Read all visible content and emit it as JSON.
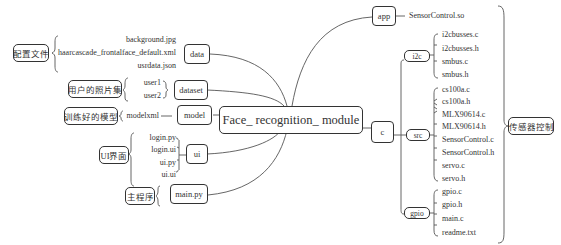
{
  "root": {
    "label": "Face_ recognition_ module"
  },
  "left_branches": [
    {
      "folder": "data",
      "annotation": "配置文件",
      "files": [
        "background.jpg",
        "haarcascade_frontalface_default.xml",
        "usrdata.json"
      ]
    },
    {
      "folder": "dataset",
      "annotation": "用户的照片集",
      "files": [
        "user1",
        "user2"
      ]
    },
    {
      "folder": "model",
      "annotation": "训练好的模型",
      "files": [
        "modelxml"
      ]
    },
    {
      "folder": "ui",
      "annotation": "UI界面",
      "files": [
        "login.py",
        "login.ui",
        "ui.py",
        "ui.ui"
      ]
    },
    {
      "folder": "main.py",
      "annotation": "主程序",
      "files": []
    }
  ],
  "right_branches": {
    "app": {
      "folder": "app",
      "files": [
        "SensorControl.so"
      ]
    },
    "c": {
      "folder": "c",
      "subfolders": [
        {
          "folder": "i2c",
          "files": [
            "i2cbusses.c",
            "i2cbusses.h",
            "smbus.c",
            "smbus.h"
          ]
        },
        {
          "folder": "src",
          "files": [
            "cs100a.c",
            "cs100a.h",
            "MLX90614.c",
            "MLX90614.h",
            "SensorControl.c",
            "SensorControl.h",
            "servo.c",
            "servo.h"
          ]
        },
        {
          "folder": "gpio",
          "files": [
            "gpio.c",
            "gpio.h",
            "main.c",
            "readme.txt"
          ]
        }
      ]
    },
    "annotation": "传感器控制"
  }
}
